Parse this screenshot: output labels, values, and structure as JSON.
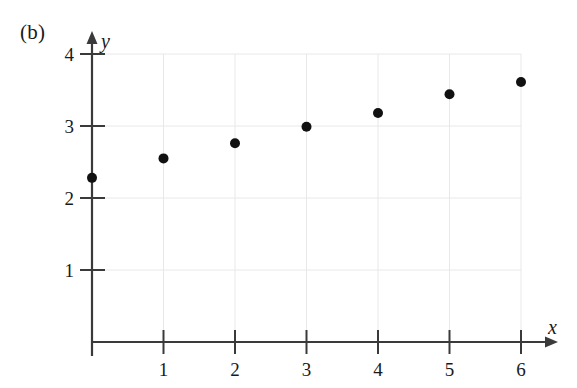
{
  "figure": {
    "panel_label": "(b)",
    "background_color": "#ffffff",
    "ink_color": "#1a1a1a",
    "grid_color": "#e8e8ea",
    "point_color": "#111111"
  },
  "chart_data": {
    "type": "scatter",
    "title": "",
    "subtitle": "",
    "xlabel": "x",
    "ylabel": "y",
    "x": [
      0,
      1,
      2,
      3,
      4,
      5,
      6
    ],
    "values": [
      2.28,
      2.55,
      2.76,
      2.99,
      3.18,
      3.44,
      3.61
    ],
    "points": [
      {
        "x": 0,
        "y": 2.28
      },
      {
        "x": 1,
        "y": 2.55
      },
      {
        "x": 2,
        "y": 2.76
      },
      {
        "x": 3,
        "y": 2.99
      },
      {
        "x": 4,
        "y": 3.18
      },
      {
        "x": 5,
        "y": 3.44
      },
      {
        "x": 6,
        "y": 3.61
      }
    ],
    "xlim": [
      0,
      6.3
    ],
    "ylim": [
      0,
      4.25
    ],
    "xticks": [
      1,
      2,
      3,
      4,
      5,
      6
    ],
    "yticks": [
      1,
      2,
      3,
      4
    ],
    "xtick_labels": [
      "1",
      "2",
      "3",
      "4",
      "5",
      "6"
    ],
    "ytick_labels": [
      "1",
      "2",
      "3",
      "4"
    ],
    "grid": true,
    "legend": null,
    "legend_position": "none",
    "annotations": [
      "(b)"
    ],
    "marker": "filled-circle",
    "marker_size": 9
  }
}
